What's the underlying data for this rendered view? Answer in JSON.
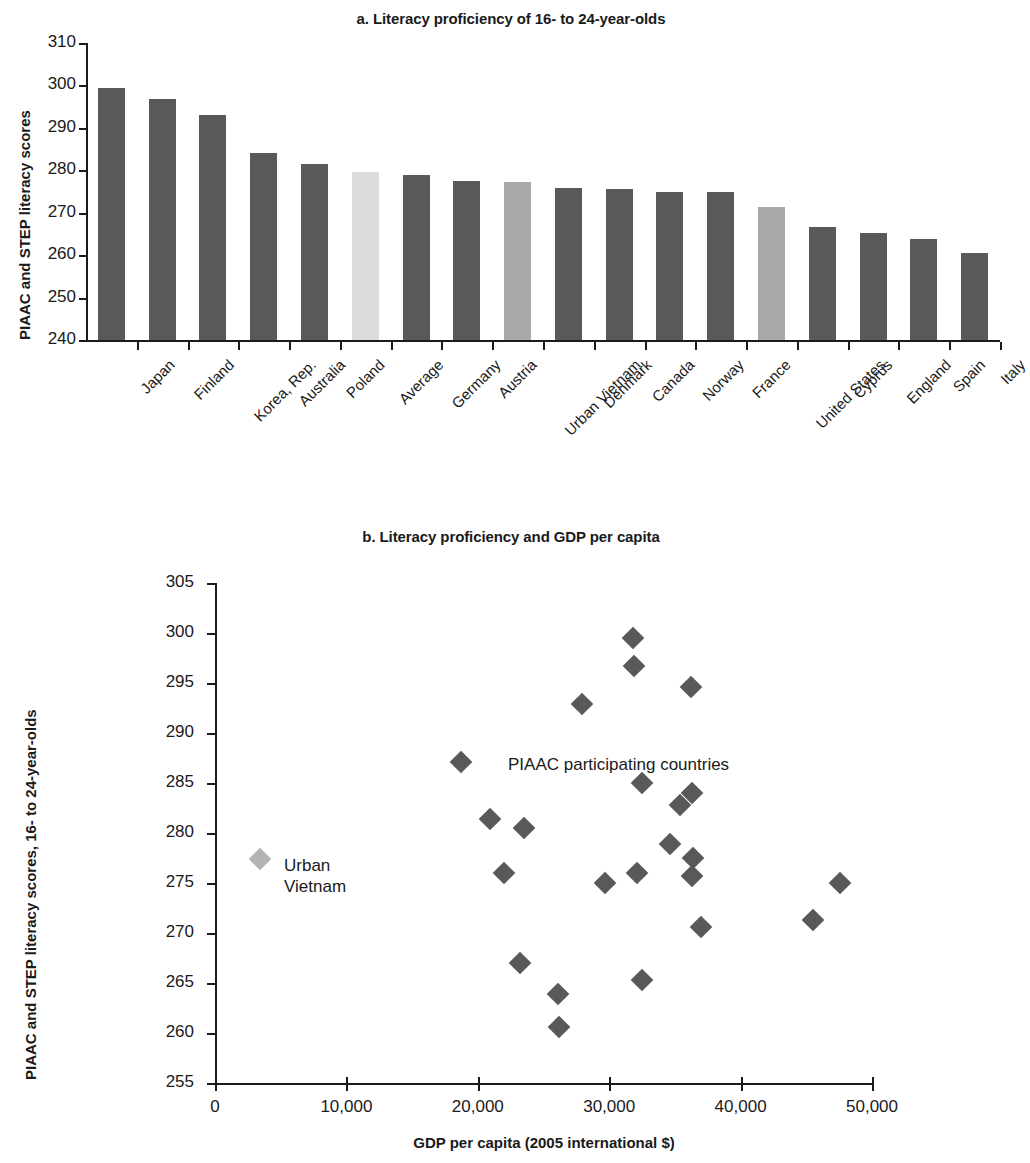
{
  "colors": {
    "bar_dark": "#595959",
    "bar_light": "#dcdcdc",
    "bar_medium": "#a8a8a8",
    "point_dark": "#595959",
    "point_light": "#b4b4b4",
    "axis": "#1a1a1a",
    "text": "#1a1a1a"
  },
  "panel_a": {
    "title": "a. Literacy proficiency of 16- to 24-year-olds",
    "ylabel": "PIAAC and STEP literacy scores"
  },
  "panel_b": {
    "title": "b. Literacy proficiency and GDP per capita",
    "ylabel": "PIAAC and STEP literacy scores, 16- to 24-year-olds",
    "xlabel": "GDP per capita (2005 international $)",
    "annotations": {
      "piaac": "PIAAC participating countries",
      "vietnam_line1": "Urban",
      "vietnam_line2": "Vietnam"
    }
  },
  "chart_data": [
    {
      "type": "bar",
      "title": "a. Literacy proficiency of 16- to 24-year-olds",
      "xlabel": "",
      "ylabel": "PIAAC and STEP literacy scores",
      "ylim": [
        240,
        310
      ],
      "yticks": [
        240,
        250,
        260,
        270,
        280,
        290,
        300,
        310
      ],
      "grid": false,
      "legend": "none",
      "categories": [
        "Japan",
        "Finland",
        "Korea, Rep.",
        "Australia",
        "Poland",
        "Average",
        "Germany",
        "Austria",
        "Urban Vietnam",
        "Denmark",
        "Canada",
        "Norway",
        "France",
        "United States",
        "Cyprus",
        "England",
        "Spain",
        "Italy"
      ],
      "values": [
        299.5,
        296.7,
        293.0,
        284.0,
        281.4,
        279.6,
        278.9,
        277.5,
        277.3,
        275.9,
        275.5,
        274.8,
        274.8,
        271.3,
        266.7,
        265.2,
        263.7,
        260.5
      ],
      "bar_shades": [
        "dark",
        "dark",
        "dark",
        "dark",
        "dark",
        "light",
        "dark",
        "dark",
        "medium",
        "dark",
        "dark",
        "dark",
        "dark",
        "medium",
        "dark",
        "dark",
        "dark",
        "dark"
      ]
    },
    {
      "type": "scatter",
      "title": "b. Literacy proficiency and GDP per capita",
      "xlabel": "GDP per capita (2005 international $)",
      "ylabel": "PIAAC and STEP literacy scores, 16- to 24-year-olds",
      "xlim": [
        0,
        50000
      ],
      "ylim": [
        255,
        305
      ],
      "xticks": [
        0,
        10000,
        20000,
        30000,
        40000,
        50000
      ],
      "xtick_labels": [
        "0",
        "10,000",
        "20,000",
        "30,000",
        "40,000",
        "50,000"
      ],
      "yticks": [
        255,
        260,
        265,
        270,
        275,
        280,
        285,
        290,
        295,
        300,
        305
      ],
      "grid": false,
      "legend": "none",
      "series": [
        {
          "name": "PIAAC participating countries",
          "shade": "dark",
          "points": [
            {
              "x": 31800,
              "y": 299.5
            },
            {
              "x": 31900,
              "y": 296.7
            },
            {
              "x": 36200,
              "y": 294.6
            },
            {
              "x": 27900,
              "y": 292.9
            },
            {
              "x": 18700,
              "y": 287.1
            },
            {
              "x": 32500,
              "y": 285.0
            },
            {
              "x": 36300,
              "y": 284.0
            },
            {
              "x": 35400,
              "y": 282.8
            },
            {
              "x": 20900,
              "y": 281.4
            },
            {
              "x": 23500,
              "y": 280.5
            },
            {
              "x": 34600,
              "y": 278.9
            },
            {
              "x": 36400,
              "y": 277.5
            },
            {
              "x": 36300,
              "y": 275.7
            },
            {
              "x": 22000,
              "y": 276.0
            },
            {
              "x": 32100,
              "y": 276.0
            },
            {
              "x": 29700,
              "y": 275.0
            },
            {
              "x": 47600,
              "y": 275.0
            },
            {
              "x": 45500,
              "y": 271.3
            },
            {
              "x": 37000,
              "y": 270.6
            },
            {
              "x": 23200,
              "y": 267.0
            },
            {
              "x": 32500,
              "y": 265.3
            },
            {
              "x": 26100,
              "y": 263.9
            },
            {
              "x": 26200,
              "y": 260.6
            }
          ]
        },
        {
          "name": "Urban Vietnam",
          "shade": "light",
          "points": [
            {
              "x": 3400,
              "y": 277.4
            }
          ]
        }
      ],
      "annotations": [
        {
          "text": "PIAAC participating countries",
          "x": 26500,
          "y": 289.5
        },
        {
          "text": "Urban Vietnam",
          "x": 5200,
          "y": 276.0
        }
      ]
    }
  ]
}
